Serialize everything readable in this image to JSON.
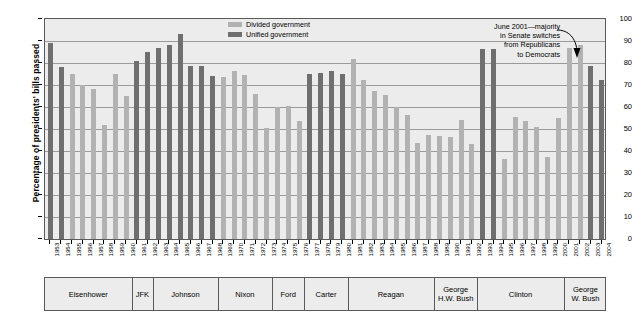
{
  "axis": {
    "ylabel": "Percentage of presidents' bills passed",
    "yticks": [
      0,
      10,
      20,
      30,
      40,
      50,
      60,
      70,
      80,
      90,
      100
    ],
    "ylim": [
      0,
      100
    ]
  },
  "legend": {
    "items": [
      {
        "label": "Divided government",
        "key": "div",
        "color": "#b2b2b2"
      },
      {
        "label": "Unified government",
        "key": "uni",
        "color": "#6f6f6f"
      }
    ]
  },
  "annotation": {
    "lines": [
      "June 2001—majority",
      "in Senate switches",
      "from Republicans",
      "to Democrats"
    ],
    "target_year": 2001
  },
  "presidents": [
    {
      "name": "Eisenhower",
      "start": 1953,
      "end": 1960
    },
    {
      "name": "JFK",
      "start": 1961,
      "end": 1962
    },
    {
      "name": "Johnson",
      "start": 1963,
      "end": 1968
    },
    {
      "name": "Nixon",
      "start": 1969,
      "end": 1973
    },
    {
      "name": "Ford",
      "start": 1974,
      "end": 1976
    },
    {
      "name": "Carter",
      "start": 1977,
      "end": 1980
    },
    {
      "name": "Reagan",
      "start": 1981,
      "end": 1988
    },
    {
      "name": "George H.W. Bush",
      "start": 1989,
      "end": 1992
    },
    {
      "name": "Clinton",
      "start": 1993,
      "end": 2000
    },
    {
      "name": "George W. Bush",
      "start": 2001,
      "end": 2004
    }
  ],
  "chart_data": {
    "type": "bar",
    "title": "",
    "xlabel": "",
    "ylabel": "Percentage of presidents' bills passed",
    "ylim": [
      0,
      100
    ],
    "grid": true,
    "legend_position": "top-center",
    "categories": [
      1953,
      1954,
      1955,
      1956,
      1957,
      1958,
      1959,
      1960,
      1961,
      1962,
      1963,
      1964,
      1965,
      1966,
      1967,
      1968,
      1969,
      1970,
      1971,
      1972,
      1973,
      1974,
      1975,
      1976,
      1977,
      1978,
      1979,
      1980,
      1981,
      1982,
      1983,
      1984,
      1985,
      1986,
      1987,
      1988,
      1989,
      1990,
      1991,
      1992,
      1993,
      1994,
      1995,
      1996,
      1997,
      1998,
      1999,
      2000,
      2001,
      2002,
      2003,
      2004
    ],
    "values": [
      89,
      78,
      75,
      70,
      68,
      52,
      75,
      65,
      81,
      85,
      87,
      88,
      93,
      78.5,
      78.5,
      74,
      73.5,
      76.5,
      74.5,
      66,
      50.5,
      60,
      60.5,
      53.5,
      75,
      75.5,
      76.5,
      75,
      82,
      72.5,
      67.5,
      65.5,
      60,
      56.5,
      43.5,
      47.5,
      47,
      46.5,
      54,
      43,
      86.5,
      86.5,
      36.5,
      55.5,
      53.5,
      51,
      37.5,
      55,
      87,
      88,
      78.5,
      72.5
    ],
    "government": [
      "unified",
      "unified",
      "divided",
      "divided",
      "divided",
      "divided",
      "divided",
      "divided",
      "unified",
      "unified",
      "unified",
      "unified",
      "unified",
      "unified",
      "unified",
      "unified",
      "divided",
      "divided",
      "divided",
      "divided",
      "divided",
      "divided",
      "divided",
      "divided",
      "unified",
      "unified",
      "unified",
      "unified",
      "divided",
      "divided",
      "divided",
      "divided",
      "divided",
      "divided",
      "divided",
      "divided",
      "divided",
      "divided",
      "divided",
      "divided",
      "unified",
      "unified",
      "divided",
      "divided",
      "divided",
      "divided",
      "divided",
      "divided",
      "divided",
      "divided",
      "unified",
      "unified"
    ]
  }
}
